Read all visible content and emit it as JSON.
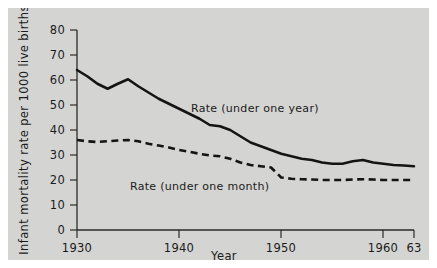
{
  "figure": {
    "background_color": "#d4d4d2",
    "page_color": "#ffffff",
    "ink_color": "#141414"
  },
  "axes": {
    "y_title": "Infant mortality rate per 1000 live births",
    "x_title": "Year",
    "y_ticks": [
      "0",
      "10",
      "20",
      "30",
      "40",
      "50",
      "60",
      "70",
      "80"
    ],
    "x_ticks": [
      "1930",
      "1940",
      "1950",
      "1960",
      "63"
    ]
  },
  "labels": {
    "series_one": "Rate (under one year)",
    "series_two": "Rate  (under one month)"
  },
  "chart_data": {
    "type": "line",
    "title": "",
    "xlabel": "Year",
    "ylabel": "Infant mortality rate per 1000 live births",
    "xlim": [
      1930,
      1963
    ],
    "ylim": [
      0,
      80
    ],
    "xticks": [
      1930,
      1940,
      1950,
      1960,
      1963
    ],
    "xticklabels": [
      "1930",
      "1940",
      "1950",
      "1960",
      "63"
    ],
    "yticks": [
      0,
      10,
      20,
      30,
      40,
      50,
      60,
      70,
      80
    ],
    "grid": false,
    "legend": "inline annotations",
    "x": [
      1930,
      1931,
      1932,
      1933,
      1934,
      1935,
      1936,
      1937,
      1938,
      1939,
      1940,
      1941,
      1942,
      1943,
      1944,
      1945,
      1946,
      1947,
      1948,
      1949,
      1950,
      1951,
      1952,
      1953,
      1954,
      1955,
      1956,
      1957,
      1958,
      1959,
      1960,
      1961,
      1962,
      1963
    ],
    "series": [
      {
        "name": "Rate (under one year)",
        "style": "solid",
        "values": [
          64.0,
          61.5,
          58.5,
          56.5,
          58.5,
          60.3,
          57.5,
          55.0,
          52.5,
          50.5,
          48.5,
          46.5,
          44.5,
          42.0,
          41.5,
          40.0,
          37.5,
          35.0,
          33.5,
          32.0,
          30.5,
          29.5,
          28.5,
          28.0,
          27.0,
          26.5,
          26.5,
          27.5,
          28.0,
          27.0,
          26.5,
          26.0,
          25.8,
          25.5
        ]
      },
      {
        "name": "Rate  (under one month)",
        "style": "dashed",
        "values": [
          36.0,
          35.5,
          35.2,
          35.5,
          35.8,
          36.0,
          35.5,
          34.5,
          33.8,
          33.0,
          32.0,
          31.3,
          30.5,
          29.8,
          29.5,
          28.5,
          27.0,
          26.0,
          25.5,
          25.0,
          21.0,
          20.5,
          20.3,
          20.2,
          20.0,
          20.0,
          20.0,
          20.2,
          20.3,
          20.2,
          20.0,
          20.0,
          20.0,
          20.0
        ]
      }
    ]
  }
}
